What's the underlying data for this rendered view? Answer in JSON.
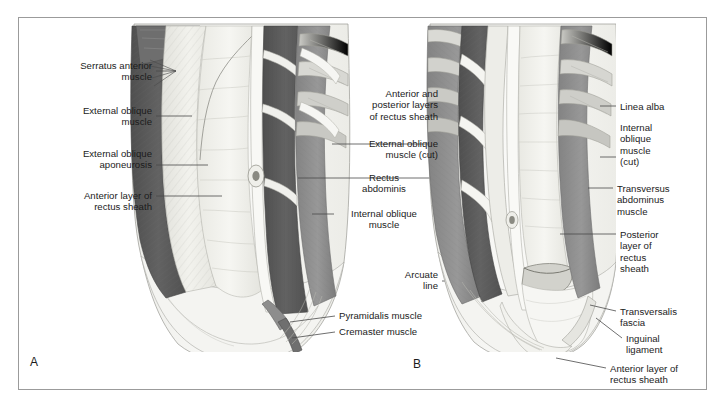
{
  "figure": {
    "type": "anatomical-illustration",
    "background_color": "#ffffff",
    "border_color": "#9b9b9b",
    "text_color": "#1b1b1b",
    "leader_line_color": "#4a4a4a"
  },
  "palette": {
    "muscle_dark": "#5d5d5d",
    "muscle_mid": "#8b8b8b",
    "muscle_light": "#b6b6b2",
    "aponeurosis": "#ececE6",
    "sheath_pale": "#f2f2ee",
    "skin_pale": "#f7f7f5",
    "rib_light": "#d4d4cf",
    "cartilage": "#c2c2bd",
    "outline": "#6f6f6f",
    "fascia_white": "#fbfbf9"
  },
  "panels": [
    {
      "id": "A",
      "label": "A",
      "x": 30,
      "y": 355,
      "description": "Superficial dissection: external oblique and anterior rectus sheath intact on the right side of the figure, reflected on the left"
    },
    {
      "id": "B",
      "label": "B",
      "x": 413,
      "y": 357,
      "description": "Deep dissection: rectus sheath opened, posterior layer, arcuate line and transversalis fascia exposed"
    }
  ],
  "labels_panel_a_left": [
    {
      "id": "serratus-anterior-muscle",
      "text": "Serratus anterior\nmuscle",
      "align": "right",
      "x": 36,
      "y": 60,
      "width": 116
    },
    {
      "id": "external-oblique-muscle",
      "text": "External oblique\nmuscle",
      "align": "right",
      "x": 36,
      "y": 105,
      "width": 116
    },
    {
      "id": "external-oblique-aponeurosis",
      "text": "External oblique\naponeurosis",
      "align": "right",
      "x": 36,
      "y": 148,
      "width": 116
    },
    {
      "id": "anterior-layer-of-rectus-sheath",
      "text": "Anterior layer of\nrectus sheath",
      "align": "right",
      "x": 36,
      "y": 190,
      "width": 116
    }
  ],
  "labels_center": [
    {
      "id": "anterior-and-posterior-layers-of-rectus-sheath",
      "text": "Anterior and\nposterior layers\nof rectus sheath",
      "align": "right",
      "x": 330,
      "y": 88,
      "width": 108
    },
    {
      "id": "external-oblique-muscle-cut",
      "text": "External oblique\nmuscle (cut)",
      "align": "right",
      "x": 330,
      "y": 138,
      "width": 108
    },
    {
      "id": "rectus-abdominis",
      "text": "Rectus\nabdominis",
      "align": "right",
      "x": 330,
      "y": 172,
      "width": 108
    },
    {
      "id": "internal-oblique-muscle",
      "text": "Internal oblique\nmuscle",
      "align": "right",
      "x": 330,
      "y": 208,
      "width": 108
    },
    {
      "id": "arcuate-line",
      "text": "Arcuate\nline",
      "align": "right",
      "x": 363,
      "y": 269,
      "width": 75
    },
    {
      "id": "pyramidalis-muscle",
      "text": "Pyramidalis muscle",
      "align": "left",
      "x": 339,
      "y": 310,
      "width": 110
    },
    {
      "id": "cremaster-muscle",
      "text": "Cremaster muscle",
      "align": "left",
      "x": 339,
      "y": 326,
      "width": 110
    }
  ],
  "labels_panel_b_right": [
    {
      "id": "linea-alba",
      "text": "Linea alba",
      "align": "left",
      "x": 620,
      "y": 101,
      "width": 90
    },
    {
      "id": "internal-oblique-muscle-cut",
      "text": "Internal\noblique\nmuscle\n(cut)",
      "align": "left",
      "x": 620,
      "y": 122,
      "width": 90
    },
    {
      "id": "transversus-abdominus-muscle",
      "text": "Transversus\nabdominus\nmuscle",
      "align": "left",
      "x": 617,
      "y": 183,
      "width": 95
    },
    {
      "id": "posterior-layer-of-rectus-sheath",
      "text": "Posterior\nlayer of\nrectus\nsheath",
      "align": "left",
      "x": 620,
      "y": 229,
      "width": 90
    },
    {
      "id": "transversalis-fascia",
      "text": "Transversalis\nfascia",
      "align": "left",
      "x": 620,
      "y": 306,
      "width": 95
    },
    {
      "id": "inguinal-ligament",
      "text": "Inguinal\nligament",
      "align": "left",
      "x": 626,
      "y": 333,
      "width": 90
    },
    {
      "id": "anterior-layer-of-rectus-sheath-b",
      "text": "Anterior layer of\nrectus sheath",
      "align": "left",
      "x": 610,
      "y": 363,
      "width": 100
    }
  ]
}
